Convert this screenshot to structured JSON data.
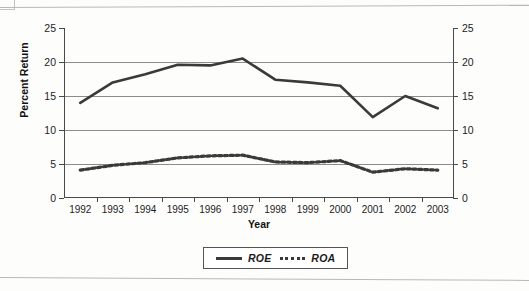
{
  "chart_data": {
    "type": "line",
    "title": "",
    "xlabel": "Year",
    "ylabel": "Percent Return",
    "categories": [
      "1992",
      "1993",
      "1994",
      "1995",
      "1996",
      "1997",
      "1998",
      "1999",
      "2000",
      "2001",
      "2002",
      "2003"
    ],
    "series": [
      {
        "name": "ROE",
        "style": "solid",
        "color": "#3a3a3a",
        "values": [
          14.0,
          17.0,
          18.2,
          19.6,
          19.5,
          20.5,
          17.4,
          17.0,
          16.5,
          11.9,
          15.0,
          13.2
        ]
      },
      {
        "name": "ROA",
        "style": "dotted",
        "color": "#3a3a3a",
        "values": [
          4.1,
          4.8,
          5.2,
          5.9,
          6.2,
          6.3,
          5.3,
          5.2,
          5.5,
          3.8,
          4.3,
          4.1
        ]
      }
    ],
    "ylim": [
      0,
      25
    ],
    "yticks": [
      0,
      5,
      10,
      15,
      20,
      25
    ],
    "y_axis_left_labels": [
      "0",
      "5",
      "10",
      "15",
      "20",
      "25"
    ],
    "y_axis_right_labels": [
      "0",
      "5",
      "10",
      "15",
      "20",
      "25"
    ],
    "secondary_yaxis": true,
    "grid": true,
    "grid_values": [
      5,
      10,
      15,
      20
    ],
    "legend_position": "bottom-center",
    "legend": [
      "ROE",
      "ROA"
    ]
  }
}
